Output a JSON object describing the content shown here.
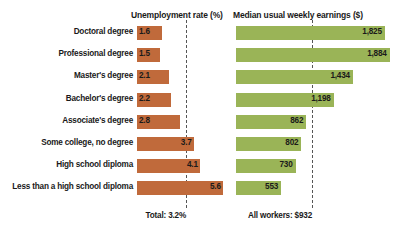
{
  "headers": {
    "unemployment": "Unemployment rate (%)",
    "earnings": "Median usual weekly earnings ($)"
  },
  "footer": {
    "total": "Total: 3.2%",
    "all_workers": "All workers: $932"
  },
  "colors": {
    "unemployment_bar": "#c06a3b",
    "earnings_bar": "#9ab457",
    "reference_line": "#555555",
    "background": "#ffffff",
    "text": "#1a1a1a"
  },
  "rows": [
    {
      "label": "Doctoral degree",
      "unemployment": "1.6",
      "earnings": "1,825"
    },
    {
      "label": "Professional degree",
      "unemployment": "1.5",
      "earnings": "1,884"
    },
    {
      "label": "Master's degree",
      "unemployment": "2.1",
      "earnings": "1,434"
    },
    {
      "label": "Bachelor's degree",
      "unemployment": "2.2",
      "earnings": "1,198"
    },
    {
      "label": "Associate's degree",
      "unemployment": "2.8",
      "earnings": "862"
    },
    {
      "label": "Some college, no degree",
      "unemployment": "3.7",
      "earnings": "802"
    },
    {
      "label": "High school diploma",
      "unemployment": "4.1",
      "earnings": "730"
    },
    {
      "label": "Less than a high school diploma",
      "unemployment": "5.6",
      "earnings": "553"
    }
  ],
  "chart_data": {
    "type": "bar",
    "title": "",
    "orientation": "horizontal",
    "categories": [
      "Doctoral degree",
      "Professional degree",
      "Master's degree",
      "Bachelor's degree",
      "Associate's degree",
      "Some college, no degree",
      "High school diploma",
      "Less than a high school diploma"
    ],
    "series": [
      {
        "name": "Unemployment rate (%)",
        "values": [
          1.6,
          1.5,
          2.1,
          2.2,
          2.8,
          3.7,
          4.1,
          5.6
        ],
        "color": "#c06a3b",
        "xlabel": "Unemployment rate (%)",
        "xlim": [
          0,
          5.6
        ],
        "reference_line": {
          "label": "Total: 3.2%",
          "value": 3.2
        }
      },
      {
        "name": "Median usual weekly earnings ($)",
        "values": [
          1825,
          1884,
          1434,
          1198,
          862,
          802,
          730,
          553
        ],
        "color": "#9ab457",
        "xlabel": "Median usual weekly earnings ($)",
        "xlim": [
          0,
          1884
        ],
        "reference_line": {
          "label": "All workers: $932",
          "value": 932
        }
      }
    ],
    "grid": false,
    "legend": "none",
    "ylabel": "",
    "annotations": [
      "Total: 3.2%",
      "All workers: $932"
    ]
  }
}
